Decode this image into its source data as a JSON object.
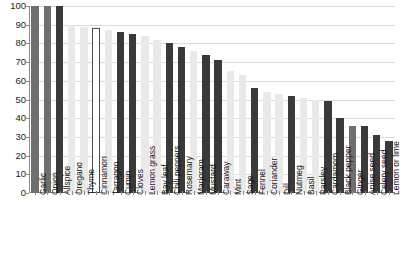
{
  "chart_data": {
    "type": "bar",
    "title": "",
    "subtitle": "",
    "xlabel": "",
    "ylabel": "",
    "ylim": [
      0,
      100
    ],
    "yticks": [
      0,
      10,
      20,
      30,
      40,
      50,
      60,
      70,
      80,
      90,
      100
    ],
    "grid": true,
    "legend": "none",
    "categories": [
      "Garlic",
      "Onion",
      "Allspice",
      "Oregano",
      "Thyme",
      "Cinnamon",
      "Tarragon",
      "Cumin",
      "Cloves",
      "Lemon grass",
      "Bay leaf",
      "Chili peppers",
      "Rosemary",
      "Marjoram",
      "Mustard",
      "Caraway",
      "Mint",
      "Sage",
      "Fennel",
      "Coriander",
      "Dill",
      "Nutmeg",
      "Basil",
      "Parsley",
      "Cardamom",
      "Black pepper",
      "Ginger",
      "Anise seed",
      "Celery seed",
      "Lemon or lime"
    ],
    "values": [
      100,
      100,
      100,
      90,
      89,
      88,
      87,
      86,
      85,
      84,
      82,
      80,
      78,
      76,
      74,
      71,
      65,
      63,
      56,
      54,
      53,
      52,
      51,
      50,
      49,
      40,
      36,
      36,
      31,
      28
    ],
    "bar_styles": [
      "medium",
      "medium",
      "dark",
      "light",
      "light",
      "hollow",
      "light",
      "dark",
      "dark",
      "light",
      "light",
      "dark",
      "dark",
      "light",
      "dark",
      "dark",
      "light",
      "light",
      "dark",
      "light",
      "light",
      "dark",
      "light",
      "light",
      "dark",
      "dark",
      "medium",
      "dark",
      "dark",
      "dark"
    ],
    "colors": {
      "dark": "#3a3a3a",
      "medium": "#6f6f6f",
      "light": "#e9e9e7",
      "hollow_fill": "#ffffff",
      "hollow_border": "#4a4a4a",
      "gridline": "#dcdcdc",
      "axis": "#8d8d8d",
      "text": "#1b1b1b"
    }
  }
}
